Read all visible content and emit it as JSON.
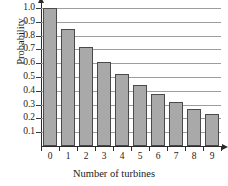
{
  "chart_data": {
    "type": "bar",
    "title": "",
    "xlabel": "Number of turbines",
    "ylabel": "Probability",
    "categories": [
      "0",
      "1",
      "2",
      "3",
      "4",
      "5",
      "6",
      "7",
      "8",
      "9"
    ],
    "values": [
      1.0,
      0.85,
      0.72,
      0.61,
      0.52,
      0.44,
      0.375,
      0.32,
      0.265,
      0.23
    ],
    "ylim": [
      0,
      1.0
    ],
    "ytick_labels": [
      "0.1",
      "0.2",
      "0.3",
      "0.4",
      "0.5",
      "0.6",
      "0.7",
      "0.8",
      "0.9",
      "1.0"
    ],
    "ytick_values": [
      0.1,
      0.2,
      0.3,
      0.4,
      0.5,
      0.6,
      0.7,
      0.8,
      0.9,
      1.0
    ],
    "grid": true,
    "legend": null,
    "bar_color": "#a9a9a9",
    "bar_edge_color": "#4a4a4a",
    "gridline_color": "#9d9d9d",
    "axis_color": "#2b2b2b"
  }
}
